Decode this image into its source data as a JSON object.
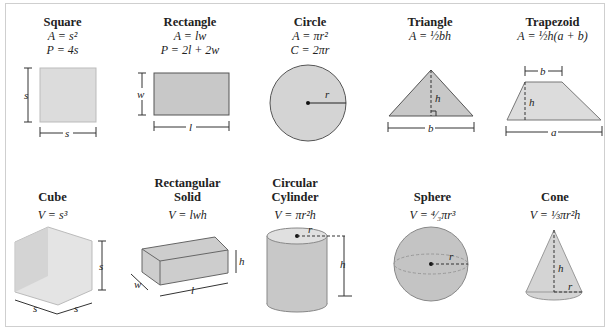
{
  "shapes2d": [
    {
      "name": "Square",
      "formulas": [
        "A = s²",
        "P = 4s"
      ],
      "labels": {
        "side": "s"
      }
    },
    {
      "name": "Rectangle",
      "formulas": [
        "A = lw",
        "P = 2l + 2w"
      ],
      "labels": {
        "length": "l",
        "width": "w"
      }
    },
    {
      "name": "Circle",
      "formulas": [
        "A = πr²",
        "C = 2πr"
      ],
      "labels": {
        "radius": "r"
      }
    },
    {
      "name": "Triangle",
      "formulas": [
        "A = ½bh"
      ],
      "labels": {
        "base": "b",
        "height": "h"
      }
    },
    {
      "name": "Trapezoid",
      "formulas": [
        "A = ½h(a + b)"
      ],
      "labels": {
        "top": "b",
        "bottom": "a",
        "height": "h"
      }
    }
  ],
  "shapes3d": [
    {
      "name": "Cube",
      "formulas": [
        "V = s³"
      ],
      "labels": {
        "side": "s"
      }
    },
    {
      "name": "Rectangular Solid",
      "formulas": [
        "V = lwh"
      ],
      "labels": {
        "length": "l",
        "width": "w",
        "height": "h"
      }
    },
    {
      "name": "Circular Cylinder",
      "formulas": [
        "V = πr²h"
      ],
      "labels": {
        "radius": "r",
        "height": "h"
      }
    },
    {
      "name": "Sphere",
      "formulas": [
        "V = ⁴⁄₃πr³"
      ],
      "labels": {
        "radius": "r"
      }
    },
    {
      "name": "Cone",
      "formulas": [
        "V = ⅓πr²h"
      ],
      "labels": {
        "radius": "r",
        "height": "h"
      }
    }
  ],
  "colors": {
    "fill": "#d4d4d4",
    "rect_fill": "#c8c8c8",
    "stroke": "#555555",
    "frame": "#cfcfcf"
  }
}
